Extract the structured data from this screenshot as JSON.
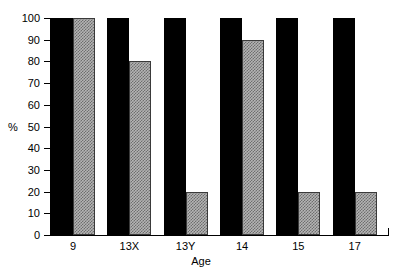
{
  "chart_data": {
    "type": "bar",
    "title": "",
    "subtitle": "",
    "xlabel": "Age",
    "ylabel": "%",
    "categories": [
      "9",
      "13X",
      "13Y",
      "14",
      "15",
      "17"
    ],
    "series": [
      {
        "name": "black-series",
        "color": "#000000",
        "values": [
          100,
          100,
          100,
          100,
          100,
          100
        ]
      },
      {
        "name": "gray-series",
        "color": "#b4b4b4",
        "values": [
          100,
          80,
          20,
          90,
          20,
          20
        ]
      }
    ],
    "ylim": [
      0,
      100
    ],
    "y_ticks": [
      0,
      10,
      20,
      30,
      40,
      50,
      60,
      70,
      80,
      90,
      100
    ],
    "y_tick_labels": [
      "0",
      "10",
      "20",
      "30",
      "40",
      "50",
      "60",
      "70",
      "80",
      "90",
      "100"
    ],
    "grid": false,
    "legend": "none",
    "legend_position": "none",
    "annotations": []
  },
  "axes": {
    "y_unit_label": "%",
    "y_unit_at_tick": 50,
    "x_title": "Age"
  }
}
